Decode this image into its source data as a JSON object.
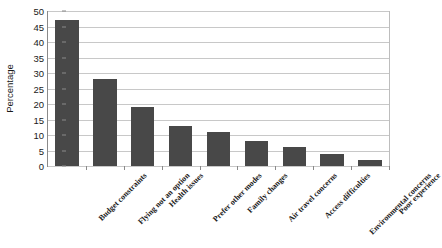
{
  "chart_data": {
    "type": "bar",
    "title": "",
    "xlabel": "",
    "ylabel": "Percentage",
    "ylim": [
      0,
      50
    ],
    "yticks": [
      0,
      5,
      10,
      15,
      20,
      25,
      30,
      35,
      40,
      45,
      50
    ],
    "grid": true,
    "legend": false,
    "bar_color": "#484848",
    "gridline_color": "#c8c8c8",
    "axis_color": "#8a8a8a",
    "background": "#ffffff",
    "categories": [
      "Budget constraints",
      "Flying not an option",
      "Health issues",
      "Prefer other modes",
      "Family changes",
      "Air travel concerns",
      "Access difficulties",
      "Environmental concerns",
      "Poor experience"
    ],
    "values": [
      47,
      28,
      19,
      13,
      11,
      8,
      6,
      4,
      2
    ]
  }
}
